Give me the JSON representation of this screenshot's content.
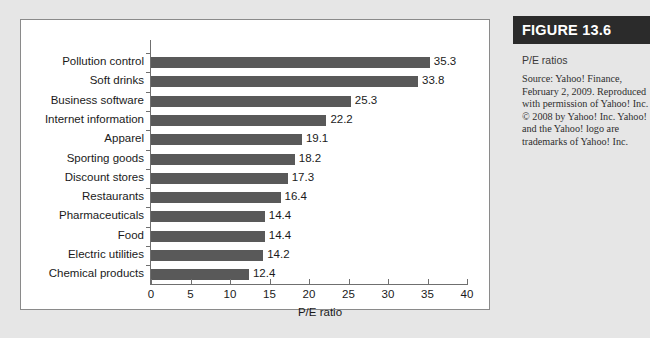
{
  "figure": {
    "header_label": "FIGURE 13.6",
    "caption": "P/E ratios",
    "source": "Source: Yahoo! Finance, February 2, 2009. Reproduced with permission of Yahoo! Inc. © 2008 by Yahoo! Inc. Yahoo! and the Yahoo! logo are trademarks of Yahoo! Inc.",
    "header_bg": "#2b2b2b",
    "header_text_color": "#ffffff"
  },
  "chart_data": {
    "type": "bar",
    "orientation": "horizontal",
    "title": "",
    "xlabel": "P/E ratio",
    "ylabel": "",
    "xlim": [
      0,
      40
    ],
    "xticks": [
      0,
      5,
      10,
      15,
      20,
      25,
      30,
      35,
      40
    ],
    "grid": false,
    "legend": false,
    "bar_color": "#595959",
    "categories": [
      "Pollution control",
      "Soft drinks",
      "Business software",
      "Internet information",
      "Apparel",
      "Sporting goods",
      "Discount stores",
      "Restaurants",
      "Pharmaceuticals",
      "Food",
      "Electric utilities",
      "Chemical products"
    ],
    "values": [
      35.3,
      33.8,
      25.3,
      22.2,
      19.1,
      18.2,
      17.3,
      16.4,
      14.4,
      14.4,
      14.2,
      12.4
    ],
    "value_labels": [
      "35.3",
      "33.8",
      "25.3",
      "22.2",
      "19.1",
      "18.2",
      "17.3",
      "16.4",
      "14.4",
      "14.4",
      "14.2",
      "12.4"
    ]
  }
}
